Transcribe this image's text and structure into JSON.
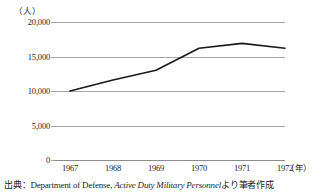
{
  "chart_data": {
    "type": "line",
    "title": "",
    "subtitle": "",
    "xlabel": "(年)",
    "ylabel": "(人)",
    "categories": [
      "1967",
      "1968",
      "1969",
      "1970",
      "1971",
      "1972"
    ],
    "x": [
      1967,
      1968,
      1969,
      1970,
      1971,
      1972
    ],
    "series": [
      {
        "name": "Active Duty Military Personnel",
        "values": [
          10000,
          11600,
          13000,
          16200,
          16900,
          16200
        ]
      }
    ],
    "ylim": [
      0,
      20000
    ],
    "yticks": [
      0,
      5000,
      10000,
      15000,
      20000
    ],
    "ytick_labels": [
      "0",
      "5,000",
      "10,000",
      "15,000",
      "20,000"
    ],
    "grid": true,
    "grid_axis": "y",
    "legend": false,
    "legend_position": "none",
    "line_color": "#1a1a1a",
    "grid_color": "#a6a6a6",
    "background": "#ffffff"
  },
  "axis": {
    "unit_y": "（人）",
    "unit_x": "（年）"
  },
  "source": {
    "prefix": "出典：Department of Defense, ",
    "italic_title": "Active Duty Military Personnel",
    "suffix": "より筆者作成"
  }
}
